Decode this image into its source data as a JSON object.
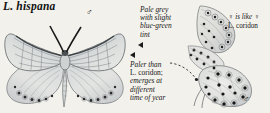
{
  "plate": {
    "background_color": "#f3f1ec",
    "ink_color": "#1c1c1c",
    "wing_pale_color": "#d9dbdc",
    "wing_blue_grey_color": "#c3c9cd",
    "spot_color": "#1a1a1a"
  },
  "title": {
    "species": "L. hispana"
  },
  "symbols": {
    "male": "♂",
    "female": "♀"
  },
  "callouts": {
    "pale_grey": {
      "line1": "Pale grey",
      "line2": "with slight",
      "line3": "blue-green",
      "line4": "tint"
    },
    "paler_than": {
      "line1_italic": "Paler than",
      "line2_roman": "L. coridon;",
      "line3_italic": "emerges at",
      "line4_italic": "different",
      "line5_italic": "time of year"
    },
    "female_like": {
      "line1": "♀ is like ♀",
      "line1_a": "♀",
      "line1_b": "is like",
      "line1_c": "♀",
      "line2": "L. coridon"
    }
  },
  "figures": {
    "male_dorsal": {
      "label": "male-upperside-spread-wings",
      "sex": "♂"
    },
    "female_wing": {
      "label": "female-underside-forewing-spotted"
    },
    "male_ventral": {
      "label": "male-underside-hindwing-spotted",
      "sex": "♂"
    }
  }
}
